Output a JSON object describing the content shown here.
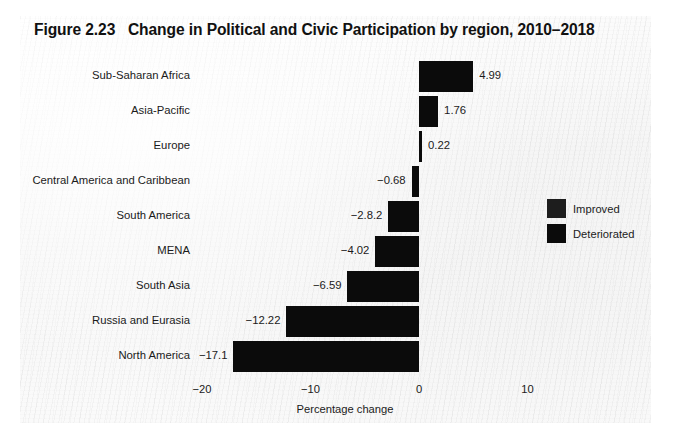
{
  "figure": {
    "title": "Figure 2.23   Change in Political and Civic Participation by region, 2010–2018"
  },
  "chart_data": {
    "type": "bar",
    "orientation": "horizontal",
    "title": "Figure 2.23   Change in Political and Civic Participation by region, 2010–2018",
    "xlabel": "Percentage change",
    "ylabel": "",
    "xlim": [
      -22.5,
      14
    ],
    "xticks": [
      -20,
      -10,
      0,
      10
    ],
    "xticklabels": [
      "−20",
      "−10",
      "0",
      "10"
    ],
    "grid": false,
    "legend_position": "right",
    "categories": [
      "Sub-Saharan Africa",
      "Asia-Pacific",
      "Europe",
      "Central America and Caribbean",
      "South America",
      "MENA",
      "South Asia",
      "Russia and Eurasia",
      "North America"
    ],
    "values": [
      4.99,
      1.76,
      0.22,
      -0.68,
      -2.82,
      -4.02,
      -6.59,
      -12.22,
      -17.1
    ],
    "value_labels": [
      "4.99",
      "1.76",
      "0.22",
      "−0.68",
      "−2.8.2",
      "−4.02",
      "−6.59",
      "−12.22",
      "−17.1"
    ],
    "series": [
      {
        "name": "Improved",
        "color": "#1d1d1d"
      },
      {
        "name": "Deteriorated",
        "color": "#0b0b0b"
      }
    ]
  },
  "axis": {
    "ticks": [
      {
        "label": "−20",
        "value": -20
      },
      {
        "label": "−10",
        "value": -10
      },
      {
        "label": "0",
        "value": 0
      },
      {
        "label": "10",
        "value": 10
      }
    ],
    "title": "Percentage change"
  },
  "legend": {
    "items": [
      {
        "label": "Improved"
      },
      {
        "label": "Deteriorated"
      }
    ]
  },
  "rows": [
    {
      "category": "Sub-Saharan Africa",
      "value_label": "4.99"
    },
    {
      "category": "Asia-Pacific",
      "value_label": "1.76"
    },
    {
      "category": "Europe",
      "value_label": "0.22"
    },
    {
      "category": "Central America and Caribbean",
      "value_label": "−0.68"
    },
    {
      "category": "South America",
      "value_label": "−2.8.2"
    },
    {
      "category": "MENA",
      "value_label": "−4.02"
    },
    {
      "category": "South Asia",
      "value_label": "−6.59"
    },
    {
      "category": "Russia and Eurasia",
      "value_label": "−12.22"
    },
    {
      "category": "North America",
      "value_label": "−17.1"
    }
  ]
}
